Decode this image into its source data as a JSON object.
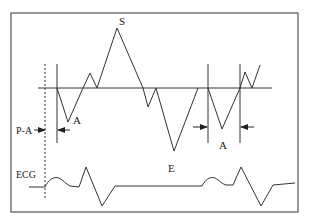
{
  "diagram": {
    "type": "waveform-timing-diagram",
    "stroke_color": "#333333",
    "frame_color": "#555555",
    "labels": {
      "peak_s": "S",
      "trough_a1": "A",
      "trough_e": "E",
      "interval_a2": "A",
      "p_a": "P-A",
      "ecg": "ECG"
    },
    "traces": [
      {
        "name": "velocity-waveform",
        "description": "Upper waveform with S peak, A and E troughs around baseline"
      },
      {
        "name": "ecg-trace",
        "description": "Lower ECG trace with two P waves and QRS complexes"
      }
    ],
    "markers": [
      {
        "name": "p-onset-dashed-line",
        "style": "dashed"
      },
      {
        "name": "a-wave-onset-line-1",
        "style": "solid"
      },
      {
        "name": "a-wave-onset-line-2",
        "style": "solid"
      },
      {
        "name": "a-wave-end-line",
        "style": "solid"
      }
    ],
    "intervals": [
      {
        "label": "P-A",
        "from": "p-onset-dashed-line",
        "to": "a-wave-onset-line-1"
      },
      {
        "label": "A",
        "from": "a-wave-onset-line-2",
        "to": "a-wave-end-line"
      }
    ]
  }
}
